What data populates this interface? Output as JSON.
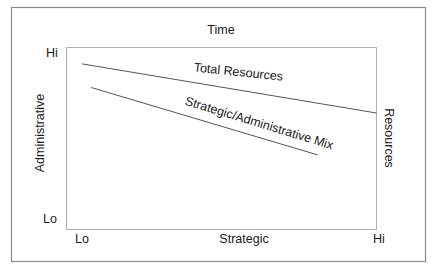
{
  "diagram": {
    "title": "Time",
    "x_axis": {
      "label": "Strategic",
      "low_label": "Lo",
      "high_label": "Hi"
    },
    "y_axis_left": {
      "label": "Administrative",
      "low_label": "Lo",
      "high_label": "Hi"
    },
    "y_axis_right": {
      "label": "Resources"
    },
    "lines": [
      {
        "name": "Total Resources",
        "label": "Total Resources",
        "trend": "decreasing",
        "start": {
          "strategic": 0.05,
          "level": 0.91
        },
        "end": {
          "strategic": 1.0,
          "level": 0.64
        }
      },
      {
        "name": "Strategic/Administrative Mix",
        "label": "Strategic/Administrative Mix",
        "trend": "decreasing",
        "start": {
          "strategic": 0.08,
          "level": 0.78
        },
        "end": {
          "strategic": 0.81,
          "level": 0.41
        }
      }
    ],
    "colors": {
      "line": "#555555",
      "frame": "#8a8a8a",
      "text": "#1a1a1a"
    }
  }
}
